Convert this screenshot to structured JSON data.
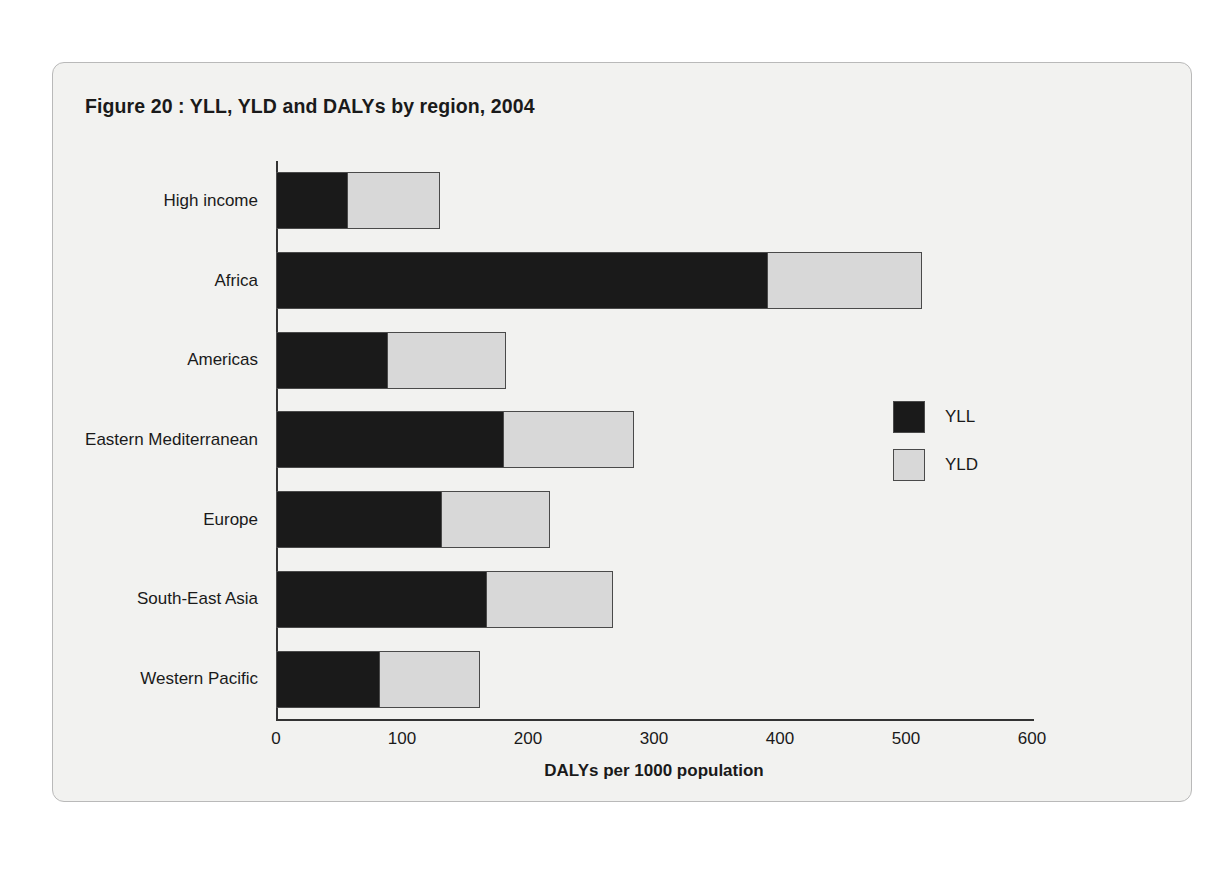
{
  "figure": {
    "title": "Figure 20 : YLL, YLD and DALYs by region, 2004"
  },
  "chart_data": {
    "type": "bar",
    "orientation": "horizontal",
    "stacked": true,
    "title": "Figure 20 : YLL, YLD and DALYs by region, 2004",
    "xlabel": "DALYs per 1000 population",
    "ylabel": "",
    "xlim": [
      0,
      600
    ],
    "xticks": [
      0,
      100,
      200,
      300,
      400,
      500,
      600
    ],
    "xtick_labels": [
      "0",
      "100",
      "200",
      "300",
      "400",
      "500",
      "600"
    ],
    "grid": false,
    "legend_position": "right",
    "categories": [
      "High income",
      "Africa",
      "Americas",
      "Eastern Mediterranean",
      "Europe",
      "South-East Asia",
      "Western Pacific"
    ],
    "series": [
      {
        "name": "YLL",
        "color": "#1a1a1a",
        "values": [
          56,
          390,
          88,
          180,
          131,
          167,
          82
        ]
      },
      {
        "name": "YLD",
        "color": "#d8d8d8",
        "values": [
          73,
          122,
          94,
          103,
          86,
          100,
          79
        ]
      }
    ],
    "totals": [
      129,
      512,
      182,
      283,
      217,
      267,
      161
    ],
    "annotations": []
  },
  "legend": {
    "items": [
      {
        "label": "YLL",
        "color": "#1a1a1a"
      },
      {
        "label": "YLD",
        "color": "#d8d8d8"
      }
    ]
  }
}
